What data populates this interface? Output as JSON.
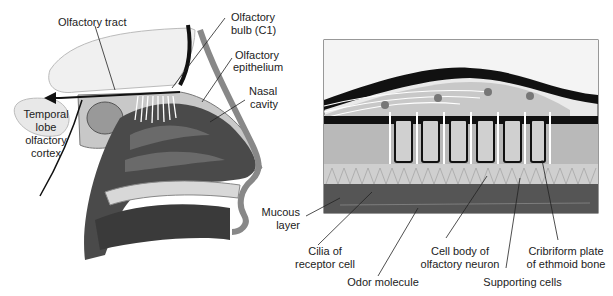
{
  "figure": {
    "left_panel": {
      "name": "Sagittal section of nasal cavity and olfactory pathway",
      "labels": {
        "olfactory_tract": "Olfactory tract",
        "olfactory_bulb_1": "Olfactory",
        "olfactory_bulb_2": "bulb (C1)",
        "olfactory_epithelium_1": "Olfactory",
        "olfactory_epithelium_2": "epithelium",
        "nasal_cavity_1": "Nasal",
        "nasal_cavity_2": "cavity",
        "temporal_1": "Temporal",
        "temporal_2": "lobe",
        "temporal_3": "olfactory",
        "temporal_4": "cortex"
      }
    },
    "right_panel": {
      "name": "Enlarged view of olfactory epithelium",
      "labels": {
        "mucous_1": "Mucous",
        "mucous_2": "layer",
        "cilia_1": "Cilia of",
        "cilia_2": "receptor cell",
        "odor": "Odor molecule",
        "cell_body_1": "Cell body of",
        "cell_body_2": "olfactory neuron",
        "supporting": "Supporting cells",
        "cribriform_1": "Cribriform plate",
        "cribriform_2": "of ethmoid bone"
      }
    },
    "colors": {
      "cavity": "#4a4a4a",
      "tissue": "#c8c8c8",
      "bone": "#b0b0b0",
      "dark": "#111111",
      "brain": "#f0f0f0",
      "mucus": "#555555"
    }
  }
}
